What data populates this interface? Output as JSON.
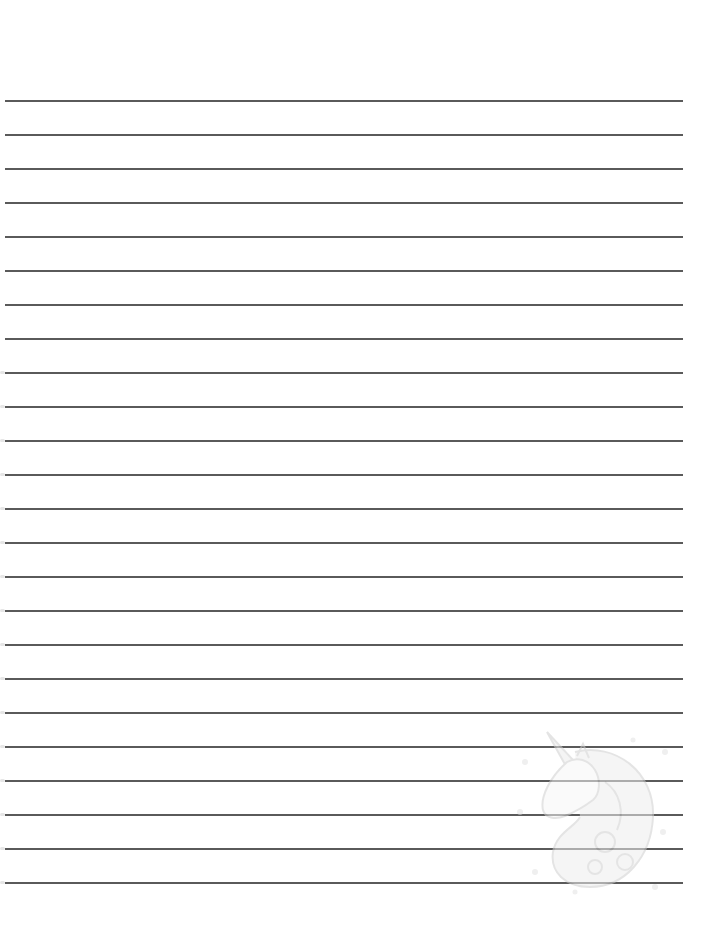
{
  "paper": {
    "type": "lined-writing-paper",
    "line_count": 24,
    "first_line_y": 100,
    "line_spacing": 34,
    "line_left_x": 5,
    "line_right_x": 683,
    "line_color": "#5a5a5a",
    "background_color": "#ffffff"
  },
  "decoration": {
    "icon": "unicorn-head-icon",
    "position": "bottom-right",
    "color": "#d6d6d6"
  }
}
